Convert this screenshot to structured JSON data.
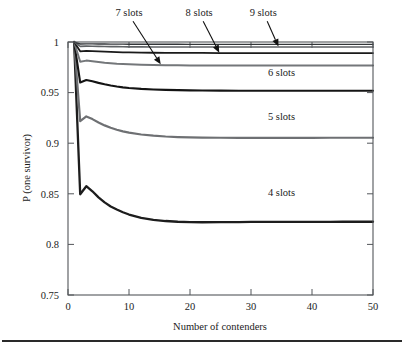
{
  "chart_data": {
    "type": "line",
    "title": "",
    "xlabel": "Number of contenders",
    "ylabel": "P (one survivor)",
    "xlim": [
      0,
      50
    ],
    "ylim": [
      0.75,
      1
    ],
    "xticks": [
      0,
      10,
      20,
      30,
      40,
      50
    ],
    "yticks": [
      0.75,
      0.8,
      0.85,
      0.9,
      0.95,
      1
    ],
    "xtick_labels": [
      "0",
      "10",
      "20",
      "30",
      "40",
      "50"
    ],
    "ytick_labels": [
      "0.75",
      "0.8",
      "0.85",
      "0.9",
      "0.95",
      "1"
    ],
    "grid": false,
    "legend_position": "inline-annotations",
    "x": [
      1,
      2,
      3,
      4,
      5,
      6,
      7,
      8,
      9,
      10,
      12,
      14,
      16,
      18,
      20,
      22,
      25,
      28,
      30,
      33,
      36,
      38,
      40,
      43,
      45,
      48,
      50
    ],
    "series": [
      {
        "name": "4 slots",
        "color": "#1d1d1d",
        "width": 2.3,
        "values": [
          1.0,
          0.8495,
          0.8575,
          0.8525,
          0.8465,
          0.8415,
          0.8375,
          0.8345,
          0.8318,
          0.8295,
          0.8262,
          0.8243,
          0.8231,
          0.8224,
          0.822,
          0.8219,
          0.822,
          0.8221,
          0.8222,
          0.8222,
          0.8223,
          0.8223,
          0.8223,
          0.8223,
          0.8224,
          0.8224,
          0.8224
        ]
      },
      {
        "name": "5 slots",
        "color": "#6e7073",
        "width": 2.2,
        "values": [
          1.0,
          0.9218,
          0.9265,
          0.9238,
          0.9205,
          0.9176,
          0.9152,
          0.9133,
          0.9117,
          0.9104,
          0.9086,
          0.9074,
          0.9066,
          0.9061,
          0.9058,
          0.9056,
          0.9054,
          0.9053,
          0.9053,
          0.9053,
          0.9053,
          0.9053,
          0.9053,
          0.9054,
          0.9054,
          0.9054,
          0.9054
        ]
      },
      {
        "name": "6 slots",
        "color": "#141414",
        "width": 2.1,
        "values": [
          1.0,
          0.96,
          0.9625,
          0.9612,
          0.9596,
          0.9582,
          0.957,
          0.956,
          0.9552,
          0.9546,
          0.9537,
          0.9531,
          0.9527,
          0.9524,
          0.9522,
          0.9521,
          0.952,
          0.9519,
          0.9519,
          0.9519,
          0.9518,
          0.9518,
          0.9518,
          0.9518,
          0.9518,
          0.9518,
          0.9518
        ]
      },
      {
        "name": "7 slots",
        "color": "#74777a",
        "width": 2.0,
        "values": [
          1.0,
          0.9805,
          0.9816,
          0.981,
          0.9803,
          0.9796,
          0.9791,
          0.9786,
          0.9783,
          0.978,
          0.9776,
          0.9773,
          0.9771,
          0.977,
          0.9769,
          0.9769,
          0.9768,
          0.9768,
          0.9768,
          0.9768,
          0.9767,
          0.9767,
          0.9767,
          0.9767,
          0.9767,
          0.9767,
          0.9767
        ]
      },
      {
        "name": "8 slots",
        "color": "#1a1a1a",
        "width": 1.8,
        "values": [
          1.0,
          0.9908,
          0.9913,
          0.991,
          0.9907,
          0.9904,
          0.9902,
          0.99,
          0.9898,
          0.9897,
          0.9895,
          0.9894,
          0.9893,
          0.9892,
          0.9892,
          0.9892,
          0.9891,
          0.9891,
          0.9891,
          0.9891,
          0.9891,
          0.9891,
          0.9891,
          0.9891,
          0.9891,
          0.9891,
          0.9891
        ]
      },
      {
        "name": "9 slots",
        "color": "#5f6265",
        "width": 1.6,
        "values": [
          1.0,
          0.9957,
          0.9959,
          0.9958,
          0.9957,
          0.9955,
          0.9954,
          0.9954,
          0.9953,
          0.9952,
          0.9952,
          0.9951,
          0.9951,
          0.9951,
          0.995,
          0.995,
          0.995,
          0.995,
          0.995,
          0.995,
          0.995,
          0.995,
          0.995,
          0.995,
          0.995,
          0.995,
          0.995
        ]
      },
      {
        "name": "10 slots",
        "color": "#323538",
        "width": 1.4,
        "values": [
          1.0,
          0.998,
          0.9981,
          0.9981,
          0.998,
          0.998,
          0.9979,
          0.9979,
          0.9979,
          0.9978,
          0.9978,
          0.9978,
          0.9978,
          0.9978,
          0.9977,
          0.9977,
          0.9977,
          0.9977,
          0.9977,
          0.9977,
          0.9977,
          0.9977,
          0.9977,
          0.9977,
          0.9977,
          0.9977,
          0.9977
        ]
      }
    ],
    "annotations": [
      {
        "label": "7 slots",
        "label_x": 10.0,
        "label_y": 1.0255,
        "arrow_to_x": 15.2,
        "arrow_to_y": 0.978,
        "has_arrow": true
      },
      {
        "label": "8 slots",
        "label_x": 21.5,
        "label_y": 1.0255,
        "arrow_to_x": 24.8,
        "arrow_to_y": 0.9895,
        "has_arrow": true
      },
      {
        "label": "9 slots",
        "label_x": 32.0,
        "label_y": 1.0255,
        "arrow_to_x": 34.5,
        "arrow_to_y": 0.9955,
        "has_arrow": true
      },
      {
        "label": "6  slots",
        "label_x": 35.0,
        "label_y": 0.966,
        "has_arrow": false
      },
      {
        "label": "5  slots",
        "label_x": 35.0,
        "label_y": 0.9225,
        "has_arrow": false
      },
      {
        "label": "4  slots",
        "label_x": 35.0,
        "label_y": 0.848,
        "has_arrow": false
      }
    ]
  }
}
